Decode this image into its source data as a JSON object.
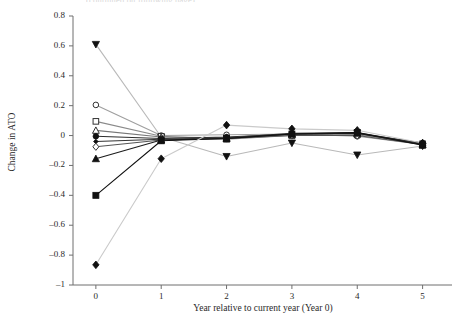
{
  "figure": {
    "cut_off_header": "(continued on following page)",
    "background_color": "#ffffff"
  },
  "chart_data": {
    "type": "line",
    "title": "",
    "xlabel": "Year relative to current year (Year 0)",
    "ylabel": "Change in ATO",
    "x": [
      0,
      1,
      2,
      3,
      4,
      5
    ],
    "xlim": [
      -0.35,
      5.45
    ],
    "ylim": [
      -1.0,
      0.8
    ],
    "xticks": [
      0,
      1,
      2,
      3,
      4,
      5
    ],
    "xtick_labels": [
      "0",
      "1",
      "2",
      "3",
      "4",
      "5"
    ],
    "yticks": [
      0.8,
      0.6,
      0.4,
      0.2,
      0,
      -0.2,
      -0.4,
      -0.6,
      -0.8,
      -1
    ],
    "ytick_labels": [
      "0.8",
      "0.6",
      "0.4",
      "0.2",
      "0",
      "–0.2",
      "–0.4",
      "–0.6",
      "–0.8",
      "–1"
    ],
    "grid": false,
    "legend": "none",
    "series": [
      {
        "name": "series-1",
        "marker": "triangle-down-filled",
        "color": "#b9b9b9",
        "marker_color": "#111111",
        "values": [
          0.61,
          -0.01,
          -0.14,
          -0.05,
          -0.13,
          -0.07
        ]
      },
      {
        "name": "series-2",
        "marker": "circle-open",
        "color": "#9f9f9f",
        "marker_color": "#333333",
        "values": [
          0.205,
          0.0,
          0.005,
          0.01,
          -0.005,
          -0.06
        ]
      },
      {
        "name": "series-3",
        "marker": "square-open",
        "color": "#8a8a8a",
        "marker_color": "#333333",
        "values": [
          0.095,
          -0.005,
          -0.025,
          0.0,
          0.005,
          -0.055
        ]
      },
      {
        "name": "series-4",
        "marker": "triangle-up-open",
        "color": "#777777",
        "marker_color": "#333333",
        "values": [
          0.035,
          -0.01,
          -0.015,
          0.005,
          0.01,
          -0.05
        ]
      },
      {
        "name": "series-5",
        "marker": "circle-filled",
        "color": "#2e2e2e",
        "marker_color": "#111111",
        "values": [
          -0.005,
          -0.02,
          -0.01,
          0.01,
          0.015,
          -0.05
        ]
      },
      {
        "name": "series-6",
        "marker": "diamond-small-filled",
        "color": "#333333",
        "marker_color": "#111111",
        "values": [
          -0.04,
          -0.025,
          -0.015,
          0.015,
          0.02,
          -0.055
        ]
      },
      {
        "name": "series-7",
        "marker": "diamond-open",
        "color": "#555555",
        "marker_color": "#333333",
        "values": [
          -0.075,
          -0.03,
          -0.02,
          0.0,
          0.0,
          -0.06
        ]
      },
      {
        "name": "series-8",
        "marker": "triangle-up-filled",
        "color": "#1c1c1c",
        "marker_color": "#111111",
        "values": [
          -0.155,
          -0.03,
          -0.02,
          0.01,
          0.015,
          -0.06
        ]
      },
      {
        "name": "series-9",
        "marker": "square-filled",
        "color": "#111111",
        "marker_color": "#111111",
        "values": [
          -0.4,
          -0.035,
          -0.02,
          0.01,
          0.02,
          -0.065
        ]
      },
      {
        "name": "series-10",
        "marker": "diamond-filled",
        "color": "#cacaca",
        "marker_color": "#111111",
        "values": [
          -0.865,
          -0.155,
          0.07,
          0.045,
          0.035,
          -0.05
        ]
      }
    ]
  }
}
